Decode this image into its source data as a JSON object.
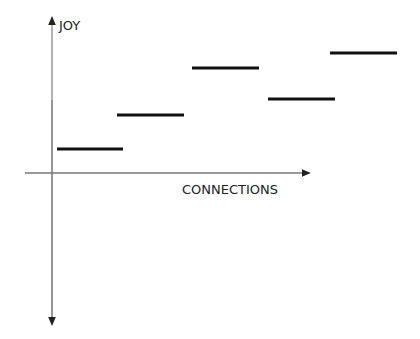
{
  "chart_data": {
    "type": "line",
    "title": "",
    "xlabel": "CONNECTIONS",
    "ylabel": "JOY",
    "grid": false,
    "legend": null,
    "segments": [
      {
        "x_start": 57,
        "x_end": 123,
        "y": 149
      },
      {
        "x_start": 117,
        "x_end": 184,
        "y": 115
      },
      {
        "x_start": 192,
        "x_end": 259,
        "y": 68
      },
      {
        "x_start": 268,
        "x_end": 335,
        "y": 99
      },
      {
        "x_start": 330,
        "x_end": 397,
        "y": 53
      }
    ],
    "relative_levels": [
      1,
      2,
      4,
      3,
      5
    ]
  },
  "axes": {
    "x_label": "CONNECTIONS",
    "y_label": "JOY"
  }
}
